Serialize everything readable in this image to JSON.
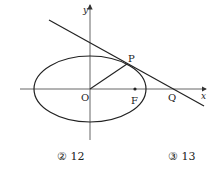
{
  "diagram": {
    "axes": {
      "x_label": "x",
      "y_label": "y",
      "origin_label": "O"
    },
    "points": {
      "P": {
        "label": "P"
      },
      "F": {
        "label": "F"
      },
      "Q": {
        "label": "Q"
      }
    },
    "shapes": [
      "ellipse centered at O",
      "tangent line through P meeting x-axis at Q",
      "segment OP",
      "focus F on positive x-axis"
    ],
    "colors": {
      "stroke": "#222222",
      "background": "#ffffff"
    }
  },
  "choices": [
    {
      "marker": "②",
      "value": "12",
      "text": "② 12"
    },
    {
      "marker": "③",
      "value": "13",
      "text": "③ 13"
    }
  ]
}
